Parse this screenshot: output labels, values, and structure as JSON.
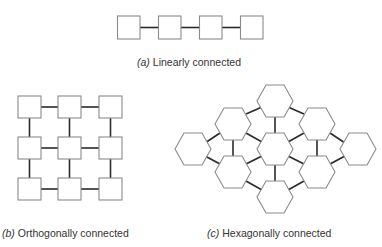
{
  "figure": {
    "panels": [
      {
        "id": "a",
        "tag": "(a)",
        "caption": "Linearly connected",
        "topology": "linear",
        "node_shape": "square",
        "node_count": 4
      },
      {
        "id": "b",
        "tag": "(b)",
        "caption": "Orthogonally connected",
        "topology": "orthogonal-grid",
        "node_shape": "square",
        "rows": 3,
        "cols": 3,
        "node_count": 9
      },
      {
        "id": "c",
        "tag": "(c)",
        "caption": "Hexagonally connected",
        "topology": "hexagonal",
        "node_shape": "hexagon",
        "node_count": 9
      }
    ],
    "colors": {
      "node_stroke": "#8a8a8a",
      "link": "#2a2a2a",
      "text": "#333333"
    }
  }
}
